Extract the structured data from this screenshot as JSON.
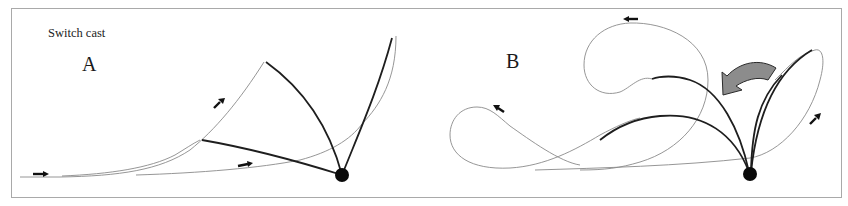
{
  "figure": {
    "title": "Switch cast",
    "panels": [
      {
        "label": "A",
        "description": "Line path sweeping upward from left, rod tip loop, pivot point at rod base",
        "direction_arrows": 3
      },
      {
        "label": "B",
        "description": "Looping line paths with curved rotation arrow indicating rod swing direction",
        "direction_arrows": 3,
        "rotation_arrow": "curved-gray-arrow-pointing-left"
      }
    ]
  },
  "colors": {
    "line": "#8a8a8a",
    "rod": "#1e1e1e",
    "pivot": "#0a0a0a",
    "rotation_arrow": "#8c8c8c",
    "frame": "#a9a9a9"
  }
}
